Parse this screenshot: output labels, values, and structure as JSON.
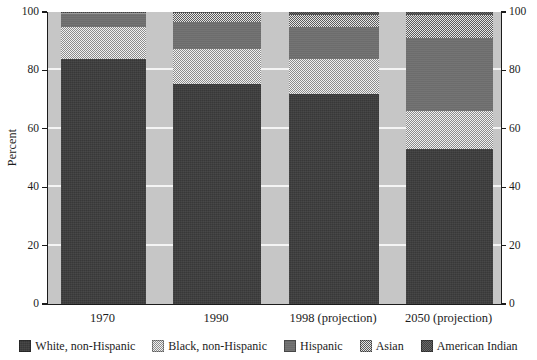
{
  "chart_data": {
    "type": "bar",
    "stacked": true,
    "title": "",
    "xlabel": "",
    "ylabel": "Percent",
    "ylim": [
      0,
      100
    ],
    "yticks": [
      0,
      20,
      40,
      60,
      80,
      100
    ],
    "ytick_labels": [
      "0",
      "20",
      "40",
      "60",
      "80",
      "100"
    ],
    "right_axis": true,
    "right_ytick_labels": [
      "0",
      "20",
      "40",
      "60",
      "80",
      "100"
    ],
    "grid": true,
    "grid_axis": "y",
    "legend_position": "bottom",
    "categories": [
      "1970",
      "1990",
      "1998 (projection)",
      "2050 (projection)"
    ],
    "series": [
      {
        "name": "White, non-Hispanic",
        "pattern": "solid-dark",
        "color": "#3b3b3b",
        "values": [
          84.0,
          75.5,
          72.0,
          53.0
        ]
      },
      {
        "name": "Black, non-Hispanic",
        "pattern": "light-speckle",
        "color": "#d9d9d9",
        "values": [
          11.0,
          12.0,
          12.0,
          13.0
        ]
      },
      {
        "name": "Hispanic",
        "pattern": "solid-mid-gray",
        "color": "#707070",
        "values": [
          4.5,
          9.0,
          11.0,
          25.0
        ]
      },
      {
        "name": "Asian",
        "pattern": "mid-speckle",
        "color": "#9a9a9a",
        "values": [
          0.3,
          3.0,
          4.0,
          8.0
        ]
      },
      {
        "name": "American Indian",
        "pattern": "dark-speckle",
        "color": "#555555",
        "values": [
          0.2,
          0.5,
          1.0,
          1.0
        ]
      }
    ]
  },
  "axes": {
    "y_title": "Percent",
    "left_ticks": [
      "100",
      "80",
      "60",
      "40",
      "20",
      "0"
    ],
    "right_ticks": [
      "100",
      "80",
      "60",
      "40",
      "20",
      "0"
    ]
  },
  "x_labels": [
    "1970",
    "1990",
    "1998 (projection)",
    "2050 (projection)"
  ],
  "legend": {
    "items": [
      {
        "label": "White, non-Hispanic"
      },
      {
        "label": "Black, non-Hispanic"
      },
      {
        "label": "Hispanic"
      },
      {
        "label": "Asian"
      },
      {
        "label": "American Indian"
      }
    ]
  },
  "colors": {
    "plot_background": "#c6c6c6",
    "gridline": "#f4f4f4",
    "axis": "#1b1b1b",
    "text": "#1c1c1c"
  }
}
